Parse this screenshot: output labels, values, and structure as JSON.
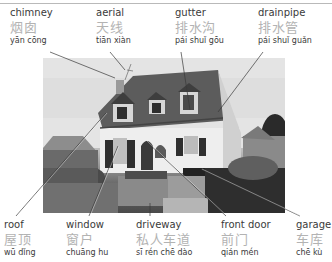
{
  "colors": {
    "english_text": "#3a3a3a",
    "chinese_text": "#b3b3b3",
    "pinyin_text": "#3a3a3a",
    "leader_line": "#3a3a3a",
    "rule": "#b9b9b9"
  },
  "photo": {
    "subject": "house"
  },
  "top_labels": [
    {
      "en": "chimney",
      "zh": "烟囱",
      "pinyin": "yān cōng"
    },
    {
      "en": "aerial",
      "zh": "天线",
      "pinyin": "tiān xiàn"
    },
    {
      "en": "gutter",
      "zh": "排水沟",
      "pinyin": "pái shuǐ gōu"
    },
    {
      "en": "drainpipe",
      "zh": "排水管",
      "pinyin": "pái shuǐ guǎn"
    }
  ],
  "bottom_labels": [
    {
      "en": "roof",
      "zh": "屋顶",
      "pinyin": "wū dǐng"
    },
    {
      "en": "window",
      "zh": "窗户",
      "pinyin": "chuāng hu"
    },
    {
      "en": "driveway",
      "zh": "私人车道",
      "pinyin": "sī rén chē dào"
    },
    {
      "en": "front door",
      "zh": "前门",
      "pinyin": "qián mén"
    },
    {
      "en": "garage",
      "zh": "车库",
      "pinyin": "chē kù"
    }
  ]
}
